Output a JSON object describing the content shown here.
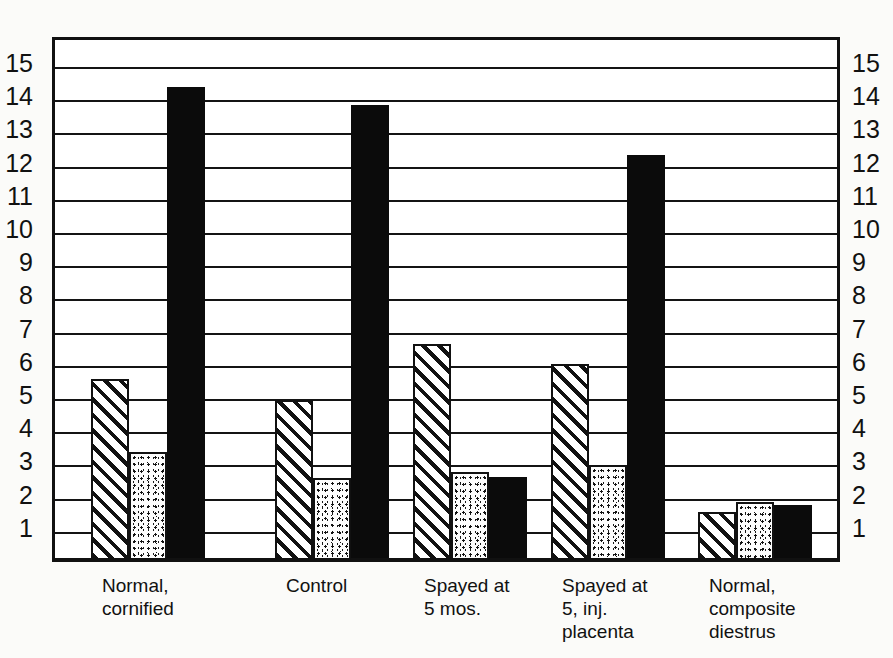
{
  "chart_data": {
    "type": "bar",
    "title": "",
    "xlabel": "",
    "ylabel": "",
    "ylim": [
      0,
      16
    ],
    "grid": true,
    "legend_position": "none",
    "y_ticks": [
      15,
      14,
      13,
      12,
      11,
      10,
      9,
      8,
      7,
      6,
      5,
      4,
      3,
      2,
      1
    ],
    "y_axis_left_ticks": [
      15,
      14,
      13,
      12,
      11,
      10,
      9,
      8,
      7,
      6,
      5,
      4,
      3,
      2,
      1
    ],
    "y_axis_right_ticks": [
      15,
      14,
      13,
      12,
      11,
      10,
      9,
      8,
      7,
      6,
      5,
      4,
      3,
      2,
      1
    ],
    "categories": [
      "Normal,\ncornified",
      "Control",
      "Spayed at\n5 mos.",
      "Spayed at\n5, inj.\nplacenta",
      "Normal,\ncomposite\ndiestrus"
    ],
    "series": [
      {
        "name": "hatched",
        "pattern": "diagonal-hatch",
        "values": [
          5.4,
          4.75,
          6.45,
          5.85,
          1.4
        ]
      },
      {
        "name": "stippled",
        "pattern": "stipple",
        "values": [
          3.2,
          2.4,
          2.6,
          2.8,
          1.7
        ]
      },
      {
        "name": "solid",
        "pattern": "solid-black",
        "values": [
          14.2,
          13.65,
          2.45,
          12.15,
          1.6
        ]
      }
    ]
  },
  "colors": {
    "ink": "#111111",
    "solid_bar": "#0b0b0b",
    "paper": "#fbfbf9",
    "plot_background": "#ffffff"
  },
  "caption_ghost": "",
  "icons": {}
}
